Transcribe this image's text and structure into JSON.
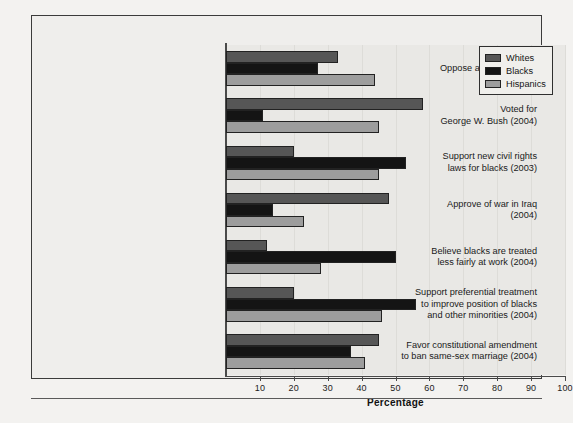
{
  "chart_data": {
    "type": "bar",
    "orientation": "horizontal",
    "title": "",
    "xlabel": "Percentage",
    "ylabel": "",
    "xlim": [
      0,
      100
    ],
    "xticks": [
      10,
      20,
      30,
      40,
      50,
      60,
      70,
      80,
      90,
      100
    ],
    "grid": true,
    "legend_position": "top-right",
    "categories": [
      "Oppose abortion (2004)",
      "Voted for\nGeorge W. Bush (2004)",
      "Support new civil rights\nlaws for blacks (2003)",
      "Approve of war in Iraq\n(2004)",
      "Believe blacks are treated\nless fairly at work (2004)",
      "Support preferential treatment\nto improve position of blacks\nand other minorities (2004)",
      "Favor constitutional amendment\nto ban same-sex marriage (2004)"
    ],
    "series": [
      {
        "name": "Whites",
        "color": "#565656",
        "values": [
          33,
          58,
          20,
          48,
          12,
          20,
          45
        ]
      },
      {
        "name": "Blacks",
        "color": "#141414",
        "values": [
          27,
          11,
          53,
          14,
          50,
          56,
          37
        ]
      },
      {
        "name": "Hispanics",
        "color": "#9d9d9d",
        "values": [
          44,
          45,
          45,
          23,
          28,
          46,
          41
        ]
      }
    ]
  },
  "axis": {
    "x_title": "Percentage",
    "tick_labels": [
      "10",
      "20",
      "30",
      "40",
      "50",
      "60",
      "70",
      "80",
      "90",
      "100"
    ]
  },
  "legend": {
    "items": [
      {
        "label": "Whites"
      },
      {
        "label": "Blacks"
      },
      {
        "label": "Hispanics"
      }
    ]
  },
  "categories": [
    {
      "lines": [
        "Oppose abortion (2004)"
      ]
    },
    {
      "lines": [
        "Voted for",
        "George W. Bush (2004)"
      ]
    },
    {
      "lines": [
        "Support new civil rights",
        "laws for blacks (2003)"
      ]
    },
    {
      "lines": [
        "Approve of war in Iraq",
        "(2004)"
      ]
    },
    {
      "lines": [
        "Believe blacks are treated",
        "less fairly at work (2004)"
      ]
    },
    {
      "lines": [
        "Support preferential treatment",
        "to improve position of blacks",
        "and other minorities (2004)"
      ]
    },
    {
      "lines": [
        "Favor constitutional amendment",
        "to ban same-sex marriage (2004)"
      ]
    }
  ]
}
